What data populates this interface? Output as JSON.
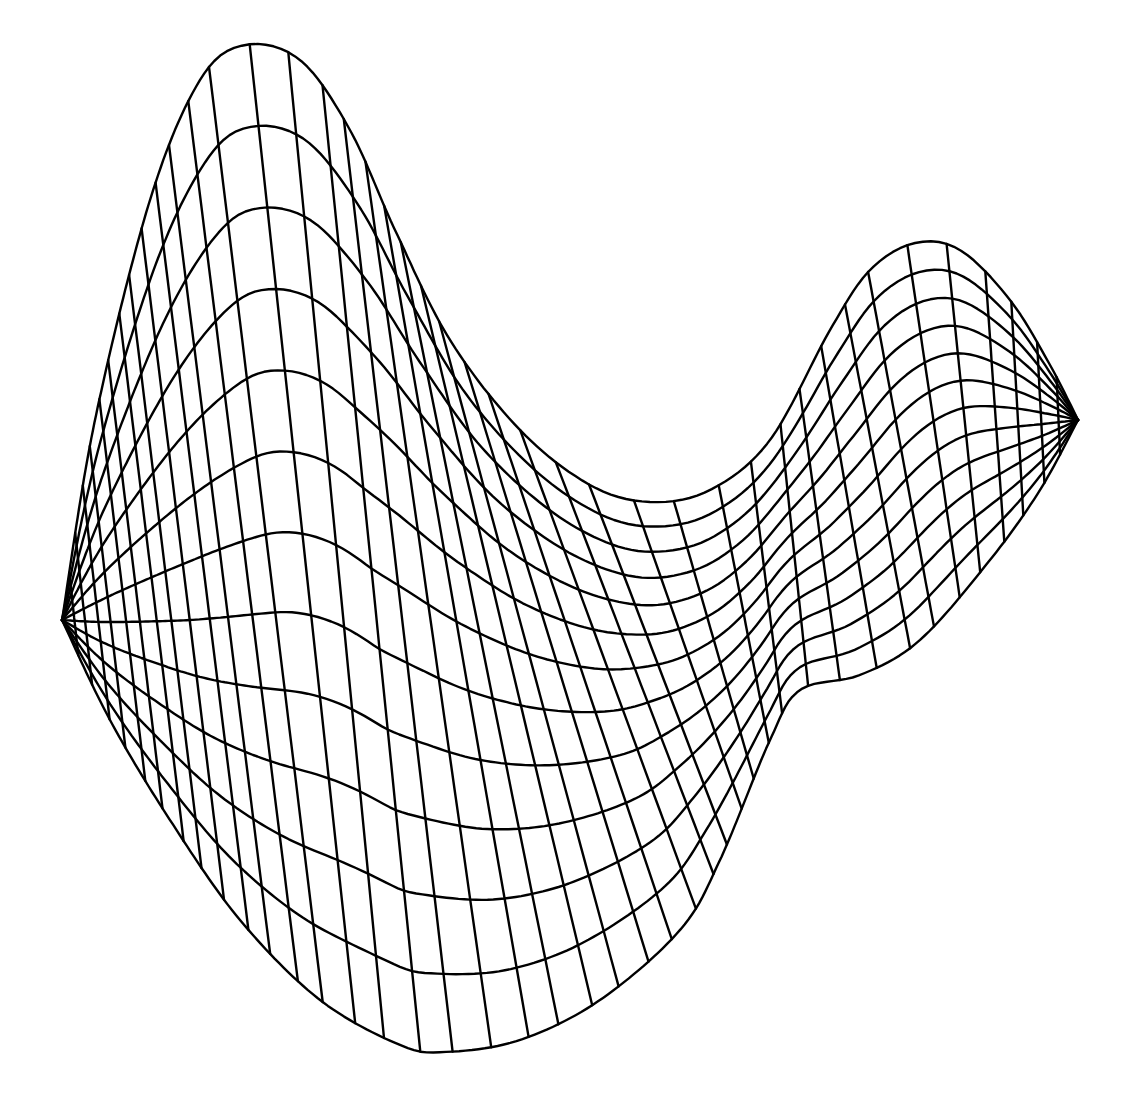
{
  "figure": {
    "background": "#ffffff",
    "line_color": "#000000",
    "line_width": 2.4
  },
  "chart_data": {
    "type": "wireframe-surface",
    "title": "",
    "surface": "saddle (hyperbolic paraboloid)",
    "axes": "none",
    "grid": {
      "long_lines": 13,
      "cross_lines": 44
    },
    "outline_top": [
      [
        62,
        620
      ],
      [
        95,
        420
      ],
      [
        150,
        200
      ],
      [
        200,
        80
      ],
      [
        245,
        45
      ],
      [
        300,
        60
      ],
      [
        350,
        130
      ],
      [
        395,
        230
      ],
      [
        450,
        340
      ],
      [
        520,
        430
      ],
      [
        590,
        485
      ],
      [
        650,
        502
      ],
      [
        710,
        490
      ],
      [
        770,
        440
      ],
      [
        830,
        330
      ],
      [
        870,
        270
      ],
      [
        915,
        243
      ],
      [
        960,
        250
      ],
      [
        1010,
        300
      ],
      [
        1050,
        365
      ],
      [
        1078,
        420
      ]
    ],
    "outline_bottom": [
      [
        62,
        620
      ],
      [
        110,
        720
      ],
      [
        170,
        820
      ],
      [
        240,
        920
      ],
      [
        320,
        1000
      ],
      [
        400,
        1045
      ],
      [
        445,
        1052
      ],
      [
        520,
        1040
      ],
      [
        600,
        1000
      ],
      [
        680,
        930
      ],
      [
        720,
        860
      ],
      [
        770,
        740
      ],
      [
        800,
        690
      ],
      [
        860,
        675
      ],
      [
        920,
        640
      ],
      [
        990,
        560
      ],
      [
        1040,
        490
      ],
      [
        1078,
        420
      ]
    ]
  }
}
